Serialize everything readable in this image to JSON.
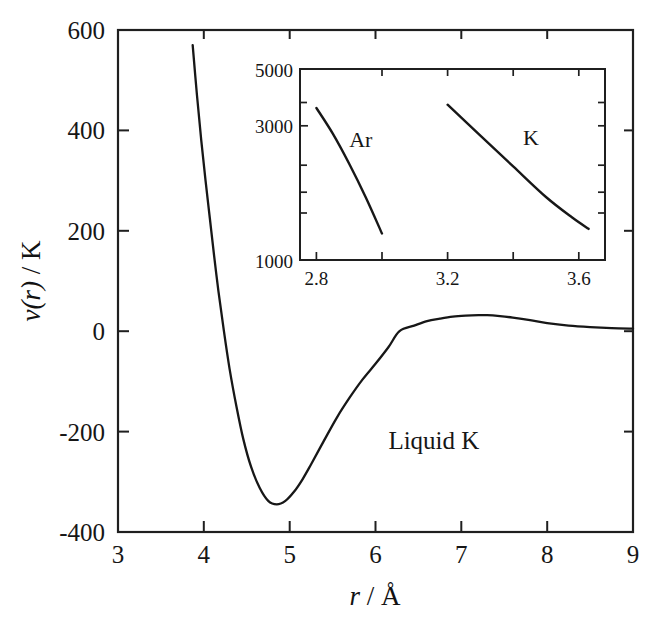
{
  "figure": {
    "name": "pair-potential-liquid-potassium",
    "background": "#ffffff",
    "line_color": "#171717",
    "axis_color": "#1f1f1f",
    "text_color": "#161616"
  },
  "main_axes": {
    "xlabel_var": "r",
    "xlabel_sep": " / ",
    "xlabel_unit": "Å",
    "ylabel_var": "v",
    "ylabel_arg": "(r)",
    "ylabel_sep": " / ",
    "ylabel_unit": "K",
    "x_ticks": [
      "3",
      "4",
      "5",
      "6",
      "7",
      "8",
      "9"
    ],
    "y_ticks": [
      "600",
      "400",
      "200",
      "0",
      "-200",
      "-400"
    ],
    "xlim": [
      3,
      9
    ],
    "ylim": [
      -400,
      600
    ],
    "annotation": "Liquid K"
  },
  "inset_axes": {
    "x_ticks_labeled": [
      "2.8",
      "3.2",
      "3.6"
    ],
    "x_ticks_all": [
      2.8,
      3.0,
      3.2,
      3.4,
      3.6
    ],
    "y_ticks": [
      "5000",
      "3000",
      "1000"
    ],
    "xlim": [
      2.75,
      3.68
    ],
    "ylim": [
      1000,
      5000
    ],
    "yscale": "log",
    "labels": [
      "Ar",
      "K"
    ]
  },
  "chart_data": {
    "type": "line",
    "title": "",
    "xlabel": "r / Å",
    "ylabel": "v(r) / K",
    "xlim": [
      3,
      9
    ],
    "ylim": [
      -400,
      600
    ],
    "grid": false,
    "legend": "none",
    "annotations": [
      {
        "text": "Liquid K",
        "x": 6.15,
        "y": -235
      }
    ],
    "series": [
      {
        "name": "Liquid K pair potential",
        "x": [
          3.87,
          3.92,
          3.97,
          4.02,
          4.07,
          4.12,
          4.17,
          4.23,
          4.3,
          4.38,
          4.46,
          4.55,
          4.65,
          4.75,
          4.85,
          4.95,
          5.05,
          5.15,
          5.25,
          5.4,
          5.55,
          5.7,
          5.85,
          6.0,
          6.15,
          6.28,
          6.45,
          6.6,
          6.75,
          6.9,
          7.05,
          7.2,
          7.3,
          7.45,
          7.6,
          7.8,
          8.0,
          8.25,
          8.5,
          8.75,
          9.0
        ],
        "y": [
          570,
          470,
          380,
          300,
          225,
          150,
          80,
          5,
          -75,
          -150,
          -215,
          -270,
          -312,
          -338,
          -345,
          -338,
          -320,
          -295,
          -265,
          -218,
          -172,
          -132,
          -96,
          -65,
          -32,
          0,
          11,
          20,
          25,
          29,
          31,
          32,
          32,
          30,
          27,
          22,
          16,
          11,
          8,
          6,
          5
        ]
      }
    ],
    "inset": {
      "type": "line",
      "xlabel": "",
      "ylabel": "",
      "xlim": [
        2.75,
        3.68
      ],
      "ylim": [
        1000,
        5000
      ],
      "yscale": "log",
      "grid": false,
      "series": [
        {
          "name": "Ar",
          "label_x": 2.9,
          "label_y": 2750,
          "x": [
            2.8,
            2.85,
            2.9,
            2.95,
            3.0
          ],
          "y": [
            3600,
            2900,
            2250,
            1700,
            1250
          ]
        },
        {
          "name": "K",
          "label_x": 3.43,
          "label_y": 2800,
          "x": [
            3.2,
            3.3,
            3.4,
            3.5,
            3.58,
            3.63
          ],
          "y": [
            3700,
            2850,
            2200,
            1700,
            1430,
            1300
          ]
        }
      ]
    }
  }
}
